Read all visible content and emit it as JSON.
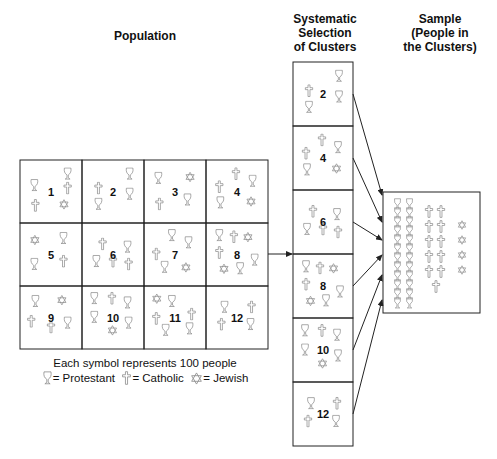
{
  "titles": {
    "population": "Population",
    "systematic": [
      "Systematic",
      "Selection",
      "of Clusters"
    ],
    "sample": [
      "Sample",
      "(People in",
      "the Clusters)"
    ]
  },
  "legend": {
    "caption": "Each symbol represents 100 people",
    "protestant": "= Protestant",
    "catholic": "= Catholic",
    "jewish": "= Jewish"
  },
  "symbols": {
    "P": "chalice-icon (Protestant)",
    "C": "cross-icon (Catholic)",
    "J": "star-of-david-icon (Jewish)"
  },
  "colors": {
    "line": "#222222",
    "symbol": "#8a8a8a"
  },
  "clusters": [
    {
      "id": "1",
      "items": [
        [
          "P",
          82,
          10
        ],
        [
          "P",
          18,
          26
        ],
        [
          "C",
          82,
          30
        ],
        [
          "C",
          20,
          54
        ],
        [
          "J",
          74,
          54
        ]
      ]
    },
    {
      "id": "2",
      "items": [
        [
          "P",
          82,
          10
        ],
        [
          "C",
          22,
          30
        ],
        [
          "P",
          82,
          38
        ],
        [
          "P",
          22,
          52
        ]
      ]
    },
    {
      "id": "3",
      "items": [
        [
          "P",
          18,
          16
        ],
        [
          "J",
          78,
          16
        ],
        [
          "C",
          20,
          52
        ],
        [
          "P",
          74,
          46
        ]
      ]
    },
    {
      "id": "4",
      "items": [
        [
          "C",
          48,
          10
        ],
        [
          "C",
          16,
          28
        ],
        [
          "P",
          80,
          20
        ],
        [
          "P",
          18,
          50
        ],
        [
          "J",
          76,
          50
        ]
      ]
    },
    {
      "id": "5",
      "items": [
        [
          "J",
          18,
          16
        ],
        [
          "P",
          74,
          12
        ],
        [
          "P",
          18,
          48
        ],
        [
          "C",
          74,
          44
        ]
      ]
    },
    {
      "id": "6",
      "items": [
        [
          "C",
          30,
          20
        ],
        [
          "P",
          78,
          24
        ],
        [
          "P",
          18,
          44
        ],
        [
          "C",
          50,
          44
        ],
        [
          "C",
          80,
          48
        ]
      ]
    },
    {
      "id": "7",
      "items": [
        [
          "P",
          44,
          8
        ],
        [
          "P",
          76,
          18
        ],
        [
          "C",
          14,
          34
        ],
        [
          "P",
          30,
          52
        ],
        [
          "J",
          70,
          54
        ]
      ]
    },
    {
      "id": "8",
      "items": [
        [
          "P",
          16,
          8
        ],
        [
          "C",
          44,
          10
        ],
        [
          "J",
          70,
          12
        ],
        [
          "C",
          16,
          32
        ],
        [
          "P",
          84,
          42
        ],
        [
          "J",
          24,
          56
        ],
        [
          "P",
          56,
          54
        ]
      ]
    },
    {
      "id": "9",
      "items": [
        [
          "P",
          20,
          12
        ],
        [
          "J",
          70,
          12
        ],
        [
          "C",
          12,
          40
        ],
        [
          "P",
          82,
          42
        ],
        [
          "C",
          50,
          48
        ]
      ]
    },
    {
      "id": "10",
      "items": [
        [
          "P",
          14,
          8
        ],
        [
          "C",
          48,
          8
        ],
        [
          "P",
          78,
          14
        ],
        [
          "P",
          14,
          34
        ],
        [
          "P",
          80,
          42
        ],
        [
          "J",
          48,
          54
        ]
      ]
    },
    {
      "id": "11",
      "items": [
        [
          "J",
          14,
          10
        ],
        [
          "P",
          44,
          12
        ],
        [
          "C",
          82,
          30
        ],
        [
          "C",
          14,
          36
        ],
        [
          "P",
          32,
          52
        ],
        [
          "P",
          78,
          50
        ]
      ]
    },
    {
      "id": "12",
      "items": [
        [
          "P",
          26,
          20
        ],
        [
          "C",
          78,
          20
        ],
        [
          "C",
          20,
          44
        ],
        [
          "P",
          76,
          44
        ]
      ]
    }
  ],
  "selected_ids": [
    "2",
    "4",
    "6",
    "8",
    "10",
    "12"
  ],
  "sample": {
    "protestant": 24,
    "catholic": 11,
    "jewish": 4
  }
}
